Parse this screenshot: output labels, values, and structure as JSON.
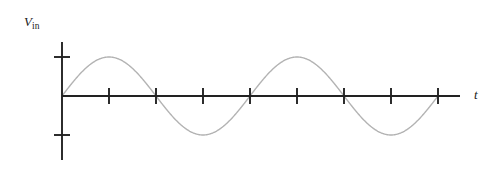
{
  "figure": {
    "width": 503,
    "height": 174,
    "background": "#ffffff"
  },
  "labels": {
    "y_axis_symbol": "V",
    "y_axis_subscript": "in",
    "y_axis_full": "Vin",
    "x_axis": "t"
  },
  "colors": {
    "axis": "#222222",
    "curve": "#b3b3b3",
    "text": "#1a1a1a",
    "background": "#ffffff"
  },
  "geometry": {
    "origin_x": 62,
    "origin_y": 96,
    "y_axis_top": 42,
    "y_axis_bottom": 160,
    "x_axis_end": 460,
    "x_tick_spacing": 47,
    "x_tick_count": 8,
    "x_tick_half_length": 8,
    "y_tick_half_length": 8,
    "amplitude_px": 39,
    "period_px": 188,
    "axis_stroke_width": 1.9,
    "curve_stroke_width": 1.4
  },
  "chart_data": {
    "type": "line",
    "title": "",
    "subtitle": "",
    "xlabel": "t",
    "ylabel": "Vin",
    "grid": false,
    "legend": null,
    "annotations": [],
    "xlim": [
      0,
      4.25
    ],
    "ylim": [
      -1.4,
      1.4
    ],
    "x_tick_labels": [
      "",
      "",
      "",
      "",
      "",
      "",
      "",
      ""
    ],
    "x_tick_values": [
      0.5,
      1.0,
      1.5,
      2.0,
      2.5,
      3.0,
      3.5,
      4.0
    ],
    "y_tick_labels": [
      "",
      ""
    ],
    "y_tick_values": [
      1,
      -1
    ],
    "series": [
      {
        "name": "Vin",
        "color": "#b3b3b3",
        "waveform": "sine",
        "amplitude": 1,
        "periods_shown": 2,
        "phase_deg": 0,
        "x_start": 0,
        "x_end": 4,
        "description": "Two full cycles of a sine wave starting at the origin rising, zero crossings at x = 0, 1, 2, 3, 4; maxima at x = 0.5 and 2.5; minima at x = 1.5 and 3.5"
      }
    ]
  }
}
